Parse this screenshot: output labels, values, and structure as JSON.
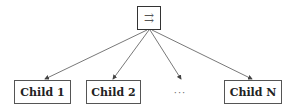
{
  "diagram": {
    "type": "tree",
    "root": {
      "symbol": "⇉",
      "icon": "rightwards-paired-arrows-icon"
    },
    "children": [
      {
        "label": "Child 1"
      },
      {
        "label": "Child 2"
      },
      {
        "label": "···"
      },
      {
        "label": "Child N"
      }
    ],
    "edges": [
      {
        "from": "root",
        "to": "Child 1"
      },
      {
        "from": "root",
        "to": "Child 2"
      },
      {
        "from": "root",
        "to": "···"
      },
      {
        "from": "root",
        "to": "Child N"
      }
    ],
    "colors": {
      "stroke": "#555555",
      "text": "#222222",
      "background": "#ffffff"
    }
  }
}
